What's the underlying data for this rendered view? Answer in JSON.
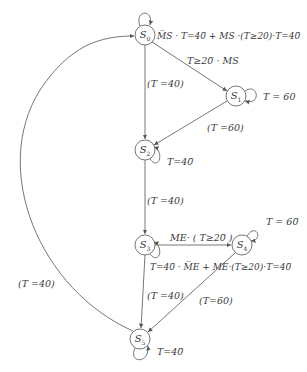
{
  "diagram": {
    "type": "state-transition-diagram",
    "colors": {
      "line": "#555555",
      "text": "#333333",
      "background": "#ffffff"
    },
    "nodes": [
      {
        "id": "S0",
        "prefix": "S",
        "sub": "0",
        "x": 145,
        "y": 35
      },
      {
        "id": "S1",
        "prefix": "S",
        "sub": "1",
        "x": 236,
        "y": 96
      },
      {
        "id": "S2",
        "prefix": "S",
        "sub": "2",
        "x": 145,
        "y": 150
      },
      {
        "id": "S3",
        "prefix": "S",
        "sub": "3",
        "x": 145,
        "y": 245
      },
      {
        "id": "S4",
        "prefix": "S",
        "sub": "4",
        "x": 242,
        "y": 245
      },
      {
        "id": "S5",
        "prefix": "S",
        "sub": "5",
        "x": 140,
        "y": 339
      }
    ],
    "labels": {
      "s0_self": "M̅S · T=40̅ + MS ·(T≥20)·T=40̅",
      "s0_s1": "T≥20̅ · MS",
      "s0_s2": "(T =40)",
      "s1_self": "T = 60",
      "s1_s2": "(T =60)",
      "s2_self": "T=40̅",
      "s2_s3": "(T =40)",
      "s3_s4": "ME· ( T≥20̅ )",
      "s4_self": "T = 60̅",
      "s3_self": "T=40̅ · M̅E + ME·(T≥20)·T=40̅",
      "s3_s5": "(T =40)",
      "s4_s5": "(T=60)",
      "s5_self": "T=40̅",
      "s5_s0": "(T =40)"
    }
  }
}
